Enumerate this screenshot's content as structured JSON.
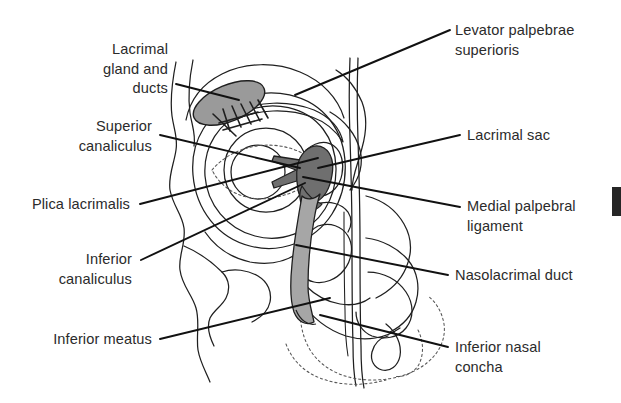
{
  "figure": {
    "width": 621,
    "height": 403,
    "background_color": "#ffffff",
    "ink_color": "#1f1f1f",
    "text_color": "#2b2b2b"
  },
  "palette": {
    "lacrimal_gland_fill": "#9a9a9a",
    "lacrimal_sac_fill": "#6f6f6f",
    "nasolacrimal_duct_fill": "#a6a6a6",
    "canaliculus_fill": "#8a8a8a",
    "outline": "#1f1f1f",
    "dotted_outline": "#555555",
    "leader_line": "#111111",
    "page_tab": "#262626"
  },
  "labels": {
    "left": [
      {
        "id": "lacrimal-gland-and-ducts",
        "text": "Lacrimal\ngland and\nducts",
        "lines": [
          "Lacrimal",
          "gland and",
          "ducts"
        ],
        "side": "left",
        "text_right_x": 168,
        "text_top_y": 40,
        "leader_start": [
          176,
          84
        ],
        "leader_end": [
          239,
          100
        ]
      },
      {
        "id": "superior-canaliculus",
        "text": "Superior\ncanaliculus",
        "lines": [
          "Superior",
          "canaliculus"
        ],
        "side": "left",
        "text_right_x": 152,
        "text_top_y": 117,
        "leader_start": [
          160,
          135
        ],
        "leader_end": [
          300,
          168
        ]
      },
      {
        "id": "plica-lacrimalis",
        "text": "Plica lacrimalis",
        "lines": [
          "Plica lacrimalis"
        ],
        "side": "left",
        "text_right_x": 130,
        "text_top_y": 195,
        "leader_start": [
          140,
          204
        ],
        "leader_end": [
          318,
          158
        ]
      },
      {
        "id": "inferior-canaliculus",
        "text": "Inferior\ncanaliculus",
        "lines": [
          "Inferior",
          "canaliculus"
        ],
        "side": "left",
        "text_right_x": 132,
        "text_top_y": 250,
        "leader_start": [
          141,
          260
        ],
        "leader_end": [
          305,
          183
        ]
      },
      {
        "id": "inferior-meatus",
        "text": "Inferior meatus",
        "lines": [
          "Inferior meatus"
        ],
        "side": "left",
        "text_right_x": 152,
        "text_top_y": 330,
        "leader_start": [
          160,
          339
        ],
        "leader_end": [
          330,
          298
        ]
      }
    ],
    "right": [
      {
        "id": "levator-palpebrae-superioris",
        "text": "Levator palpebrae\nsuperioris",
        "lines": [
          "Levator palpebrae",
          "superioris"
        ],
        "side": "right",
        "text_left_x": 455,
        "text_top_y": 21,
        "leader_start": [
          450,
          30
        ],
        "leader_end": [
          295,
          95
        ]
      },
      {
        "id": "lacrimal-sac",
        "text": "Lacrimal sac",
        "lines": [
          "Lacrimal sac"
        ],
        "side": "right",
        "text_left_x": 467,
        "text_top_y": 126,
        "leader_start": [
          460,
          135
        ],
        "leader_end": [
          318,
          168
        ]
      },
      {
        "id": "medial-palpebral-ligament",
        "text": "Medial palpebral\nligament",
        "lines": [
          "Medial palpebral",
          "ligament"
        ],
        "side": "right",
        "text_left_x": 467,
        "text_top_y": 197,
        "leader_start": [
          460,
          207
        ],
        "leader_end": [
          303,
          177
        ]
      },
      {
        "id": "nasolacrimal-duct",
        "text": "Nasolacrimal duct",
        "lines": [
          "Nasolacrimal duct"
        ],
        "side": "right",
        "text_left_x": 455,
        "text_top_y": 266,
        "leader_start": [
          448,
          275
        ],
        "leader_end": [
          296,
          245
        ]
      },
      {
        "id": "inferior-nasal-concha",
        "text": "Inferior nasal\nconcha",
        "lines": [
          "Inferior nasal",
          "concha"
        ],
        "side": "right",
        "text_left_x": 455,
        "text_top_y": 338,
        "leader_start": [
          448,
          347
        ],
        "leader_end": [
          320,
          315
        ]
      }
    ]
  },
  "page_tab": {
    "name": "thumb-index-tab",
    "x": 612,
    "y": 187,
    "width": 9,
    "height": 29,
    "color": "#262626"
  }
}
